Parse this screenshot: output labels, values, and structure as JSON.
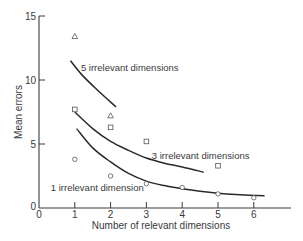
{
  "chart_data": {
    "type": "scatter",
    "title": "",
    "xlabel": "Number of relevant dimensions",
    "ylabel": "Mean errors",
    "xlim": [
      0,
      7
    ],
    "ylim": [
      0,
      15
    ],
    "x_ticks": [
      0,
      1,
      2,
      3,
      4,
      5,
      6
    ],
    "y_ticks": [
      0,
      5,
      10,
      15
    ],
    "grid": false,
    "legend": "inline labels",
    "series": [
      {
        "name": "5 irrelevant dimensions",
        "marker": "triangle",
        "points": [
          [
            1,
            13.4
          ],
          [
            2,
            7.2
          ]
        ],
        "fit_curve": [
          [
            0.88,
            11.5
          ],
          [
            1.2,
            10.4
          ],
          [
            1.6,
            9.3
          ],
          [
            2.15,
            7.9
          ]
        ]
      },
      {
        "name": "3 irrelevant dimensions",
        "marker": "square",
        "points": [
          [
            1,
            7.7
          ],
          [
            2,
            6.3
          ],
          [
            3,
            5.2
          ],
          [
            5,
            3.3
          ]
        ],
        "fit_curve": [
          [
            1.0,
            7.5
          ],
          [
            1.5,
            6.2
          ],
          [
            2.0,
            5.2
          ],
          [
            2.5,
            4.5
          ],
          [
            3.0,
            3.9
          ],
          [
            3.5,
            3.5
          ],
          [
            4.0,
            3.2
          ],
          [
            4.6,
            2.8
          ]
        ]
      },
      {
        "name": "1 irrelevant dimension",
        "marker": "circle",
        "points": [
          [
            1,
            3.8
          ],
          [
            2,
            2.5
          ],
          [
            3,
            1.9
          ],
          [
            4,
            1.6
          ],
          [
            5,
            1.1
          ],
          [
            6,
            0.8
          ]
        ],
        "fit_curve": [
          [
            1.05,
            6.2
          ],
          [
            1.5,
            4.7
          ],
          [
            2.0,
            3.6
          ],
          [
            2.5,
            2.7
          ],
          [
            3.0,
            2.1
          ],
          [
            3.5,
            1.75
          ],
          [
            4.0,
            1.5
          ],
          [
            4.5,
            1.3
          ],
          [
            5.0,
            1.15
          ],
          [
            5.5,
            1.05
          ],
          [
            6.3,
            0.95
          ]
        ]
      }
    ],
    "annotations": [
      {
        "text": "5 irrelevant dimensions",
        "x": 1.17,
        "y": 10.7
      },
      {
        "text": "3 irrelevant dimensions",
        "x": 3.15,
        "y": 3.8
      },
      {
        "text": "1 irrelevant dimension",
        "x": 0.33,
        "y": 1.35
      }
    ]
  }
}
